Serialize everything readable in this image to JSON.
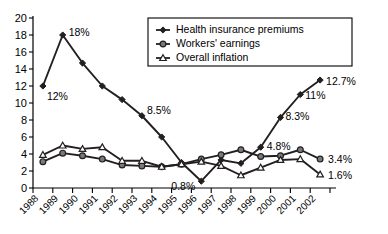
{
  "chart_data": {
    "type": "line",
    "title": "",
    "xlabel": "",
    "ylabel": "",
    "ylim": [
      0,
      20
    ],
    "ytick_step": 2,
    "grid": false,
    "legend_position": "top-right",
    "categories": [
      "1988",
      "1989",
      "1990",
      "1991",
      "1992",
      "1993",
      "1994",
      "1995",
      "1996",
      "1997",
      "1998",
      "1999",
      "2000",
      "2001",
      "2002"
    ],
    "yticks": [
      "0",
      "2",
      "4",
      "6",
      "8",
      "10",
      "12",
      "14",
      "16",
      "18",
      "20"
    ],
    "series": [
      {
        "name": "Health insurance premiums",
        "marker": "filled-diamond",
        "values": [
          12.0,
          18.0,
          14.7,
          12.0,
          10.4,
          8.5,
          6.0,
          3.0,
          0.8,
          3.3,
          2.9,
          4.8,
          8.3,
          11.0,
          12.7
        ],
        "point_labels": [
          {
            "category": "1988",
            "text": "12%"
          },
          {
            "category": "1989",
            "text": "18%"
          },
          {
            "category": "1993",
            "text": "8.5%"
          },
          {
            "category": "1996",
            "text": "0.8%"
          },
          {
            "category": "1999",
            "text": "4.8%"
          },
          {
            "category": "2000",
            "text": "8.3%"
          },
          {
            "category": "2001",
            "text": "11%"
          },
          {
            "category": "2002",
            "text": "12.7%"
          }
        ]
      },
      {
        "name": "Workers' earnings",
        "marker": "filled-circle",
        "values": [
          3.1,
          4.1,
          3.8,
          3.4,
          2.7,
          2.6,
          2.5,
          2.8,
          3.4,
          3.9,
          4.5,
          3.7,
          3.8,
          4.5,
          3.4
        ],
        "point_labels": [
          {
            "category": "2002",
            "text": "3.4%"
          }
        ]
      },
      {
        "name": "Overall inflation",
        "marker": "open-triangle",
        "values": [
          3.9,
          5.0,
          4.6,
          4.8,
          3.2,
          3.2,
          2.5,
          2.8,
          3.1,
          2.6,
          1.5,
          2.4,
          3.3,
          3.4,
          1.6
        ],
        "point_labels": [
          {
            "category": "2002",
            "text": "1.6%"
          }
        ]
      }
    ]
  },
  "legend": {
    "entries": [
      {
        "label": "Health insurance premiums",
        "marker": "filled-diamond"
      },
      {
        "label": "Workers' earnings",
        "marker": "filled-circle"
      },
      {
        "label": "Overall inflation",
        "marker": "open-triangle"
      }
    ]
  }
}
